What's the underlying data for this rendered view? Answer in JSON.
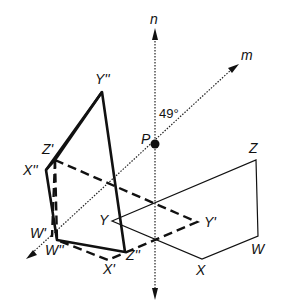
{
  "diagram": {
    "axes": {
      "vertical": "n",
      "diagonal": "m"
    },
    "center_point": "P",
    "angle": "49°",
    "original_figure": [
      "W",
      "X",
      "Y",
      "Z"
    ],
    "first_reflection": [
      "W'",
      "X'",
      "Y'",
      "Z'"
    ],
    "second_reflection": [
      "W''",
      "X''",
      "Y''",
      "Z''"
    ]
  },
  "labels": {
    "n": "n",
    "m": "m",
    "P": "P",
    "angle": "49°",
    "Y2": "Y''",
    "Z1": "Z'",
    "X2": "X''",
    "W1": "W'",
    "W2": "W''",
    "X1": "X'",
    "Z2": "Z''",
    "Y1": "Y'",
    "Y": "Y",
    "Z": "Z",
    "W": "W",
    "X": "X"
  }
}
